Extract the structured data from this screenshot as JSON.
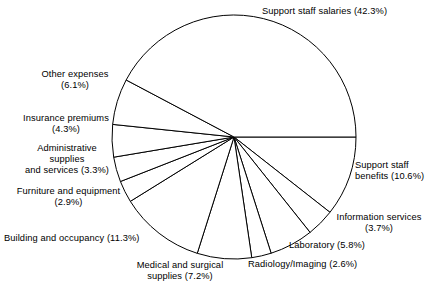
{
  "chart_data": {
    "type": "pie",
    "title": "",
    "subtitle": "",
    "xlabel": "",
    "ylabel": "",
    "legend_position": "none",
    "grid": false,
    "units": "percent",
    "start_angle_deg": 0,
    "direction": "clockwise",
    "categories": [
      "Support staff benefits",
      "Information services",
      "Laboratory",
      "Radiology/Imaging",
      "Medical and surgical supplies",
      "Building and occupancy",
      "Furniture and equipment",
      "Administrative supplies and services",
      "Insurance premiums",
      "Other expenses",
      "Support staff salaries"
    ],
    "values": [
      10.6,
      3.7,
      5.8,
      2.6,
      7.2,
      11.3,
      2.9,
      3.3,
      4.3,
      6.1,
      42.3
    ],
    "slices": [
      {
        "label": "Support staff benefits",
        "value": 10.6,
        "text": "Support staff\nbenefits (10.6%)"
      },
      {
        "label": "Information services",
        "value": 3.7,
        "text": "Information services\n(3.7%)"
      },
      {
        "label": "Laboratory",
        "value": 5.8,
        "text": "Laboratory (5.8%)"
      },
      {
        "label": "Radiology/Imaging",
        "value": 2.6,
        "text": "Radiology/Imaging (2.6%)"
      },
      {
        "label": "Medical and surgical supplies",
        "value": 7.2,
        "text": "Medical and surgical\nsupplies (7.2%)"
      },
      {
        "label": "Building and occupancy",
        "value": 11.3,
        "text": "Building and occupancy (11.3%)"
      },
      {
        "label": "Furniture and equipment",
        "value": 2.9,
        "text": "Furniture and equipment\n(2.9%)"
      },
      {
        "label": "Administrative supplies and services",
        "value": 3.3,
        "text": "Administrative\nsupplies\nand services (3.3%)"
      },
      {
        "label": "Insurance premiums",
        "value": 4.3,
        "text": "Insurance premiums\n(4.3%)"
      },
      {
        "label": "Other expenses",
        "value": 6.1,
        "text": "Other expenses\n(6.1%)"
      },
      {
        "label": "Support staff salaries",
        "value": 42.3,
        "text": "Support staff salaries (42.3%)"
      }
    ]
  },
  "colors": {
    "slice_fill": "#ffffff",
    "slice_stroke": "#000000",
    "label_text": "#000000",
    "background": "#ffffff"
  }
}
